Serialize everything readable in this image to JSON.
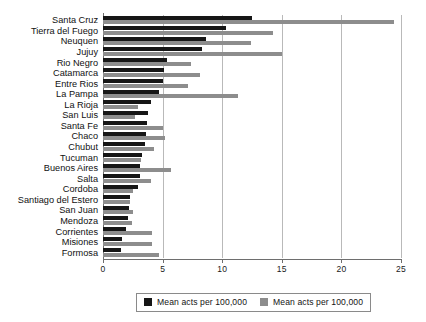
{
  "chart_data": {
    "type": "bar",
    "orientation": "horizontal",
    "title": "",
    "xlabel": "",
    "ylabel": "",
    "xlim": [
      0,
      25
    ],
    "xticks": [
      0,
      5,
      10,
      15,
      20,
      25
    ],
    "xtick_labels": [
      "0",
      "5",
      "10",
      "15",
      "20",
      "25"
    ],
    "grid": true,
    "legend_position": "bottom-center",
    "categories": [
      "Santa Cruz",
      "Tierra del Fuego",
      "Neuquen",
      "Jujuy",
      "Rio Negro",
      "Catamarca",
      "Entre Rios",
      "La Pampa",
      "La Rioja",
      "San Luis",
      "Santa Fe",
      "Chaco",
      "Chubut",
      "Tucuman",
      "Buenos Aires",
      "Salta",
      "Cordoba",
      "Santiago del Estero",
      "San Juan",
      "Mendoza",
      "Corrientes",
      "Misiones",
      "Formosa"
    ],
    "series": [
      {
        "name": "Mean acts per 100,000",
        "color": "#161616",
        "values": [
          12.5,
          10.3,
          8.6,
          8.3,
          5.4,
          5.1,
          5.0,
          4.7,
          4.0,
          3.8,
          3.7,
          3.6,
          3.5,
          3.3,
          3.1,
          3.1,
          2.9,
          2.3,
          2.2,
          2.1,
          1.9,
          1.6,
          1.5
        ]
      },
      {
        "name": "Mean acts per 100,000",
        "color": "#8d8d8d",
        "values": [
          24.4,
          14.3,
          12.4,
          15.0,
          7.4,
          8.1,
          7.1,
          11.3,
          2.9,
          2.7,
          5.0,
          5.2,
          4.3,
          3.2,
          5.7,
          4.0,
          2.5,
          2.3,
          2.5,
          2.4,
          4.1,
          4.1,
          4.7
        ]
      }
    ]
  },
  "legend": {
    "items": [
      {
        "label": "Mean acts per 100,000",
        "swatch": "black-square"
      },
      {
        "label": "Mean acts per 100,000",
        "swatch": "gray-square"
      }
    ]
  }
}
